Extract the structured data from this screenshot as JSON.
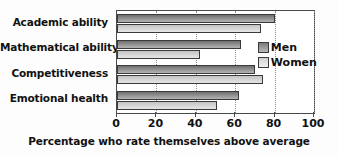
{
  "chart_data": {
    "type": "bar",
    "orientation": "horizontal",
    "title": "",
    "xlabel": "Percentage who rate themselves above average",
    "ylabel": "",
    "xlim": [
      0,
      100
    ],
    "xticks": [
      0,
      20,
      40,
      60,
      80,
      100
    ],
    "grid": true,
    "legend_position": "inside-upper-right",
    "categories": [
      "Academic ability",
      "Mathematical ability",
      "Competitiveness",
      "Emotional health"
    ],
    "series": [
      {
        "name": "Men",
        "color": "#8e8e8e",
        "values": [
          80,
          63,
          70,
          62
        ]
      },
      {
        "name": "Women",
        "color": "#d3d3d3",
        "values": [
          73,
          42,
          74,
          51
        ]
      }
    ]
  },
  "axis": {
    "tick_labels": [
      "0",
      "20",
      "40",
      "60",
      "80",
      "100"
    ],
    "title": "Percentage who rate themselves above average"
  },
  "legend": {
    "items": [
      {
        "label": "Men"
      },
      {
        "label": "Women"
      }
    ]
  },
  "colors": {
    "men_bar": "#8e8e8e",
    "women_bar": "#d3d3d3",
    "frame": "#4a4a4a",
    "gridline": "#8c8c8c",
    "text": "#111111",
    "background": "#ffffff"
  }
}
